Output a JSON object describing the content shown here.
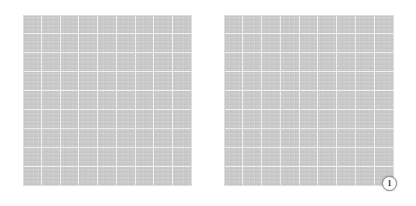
{
  "page": {
    "background_color": "#ffffff",
    "width": 416,
    "height": 206
  },
  "panels": [
    {
      "id": "left-grid-panel",
      "label": "",
      "fill_color": "#c9c9c9",
      "gridline_color": "#f2f2f2",
      "columns": 9,
      "rows": 9
    },
    {
      "id": "right-grid-panel",
      "label": "",
      "fill_color": "#c9c9c9",
      "gridline_color": "#f2f2f2",
      "columns": 9,
      "rows": 9
    }
  ],
  "badges": [
    {
      "id": "badge-1",
      "text": "1",
      "background_color": "#fdfdfd",
      "border_color": "#8d8d8d",
      "text_color": "#2a2a2a",
      "attached_to": "right-grid-panel"
    }
  ]
}
